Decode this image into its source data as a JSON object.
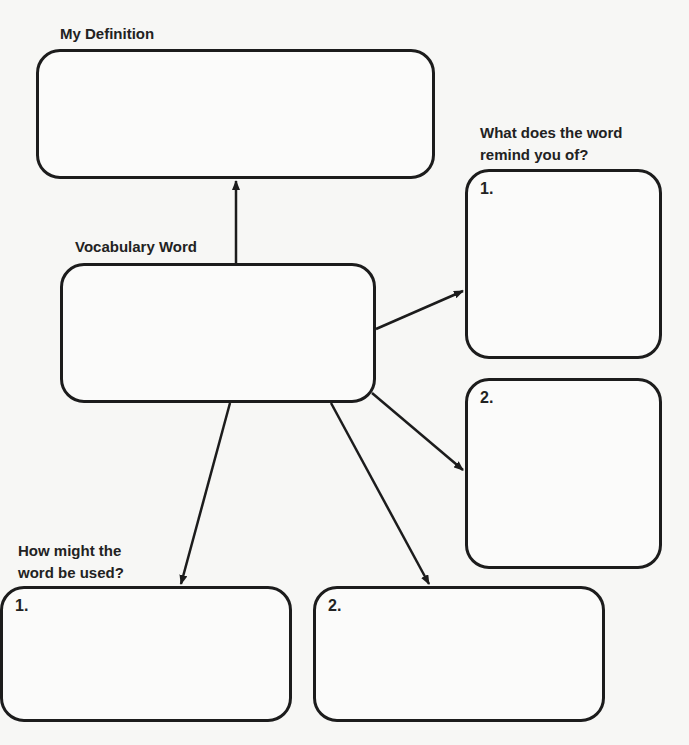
{
  "diagram": {
    "definition": {
      "label": "My Definition",
      "value": ""
    },
    "vocabulary": {
      "label": "Vocabulary Word",
      "value": ""
    },
    "remind": {
      "label": "What does the word\nremind you of?",
      "boxes": [
        {
          "number": "1.",
          "value": ""
        },
        {
          "number": "2.",
          "value": ""
        }
      ]
    },
    "usage": {
      "label": "How might the\nword be used?",
      "boxes": [
        {
          "number": "1.",
          "value": ""
        },
        {
          "number": "2.",
          "value": ""
        }
      ]
    },
    "connections": [
      {
        "from": "vocabulary",
        "to": "definition"
      },
      {
        "from": "vocabulary",
        "to": "remind-1"
      },
      {
        "from": "vocabulary",
        "to": "remind-2"
      },
      {
        "from": "vocabulary",
        "to": "usage-1"
      },
      {
        "from": "vocabulary",
        "to": "usage-2"
      }
    ],
    "colors": {
      "stroke": "#1c1c1c",
      "paper": "#f7f7f5"
    }
  }
}
